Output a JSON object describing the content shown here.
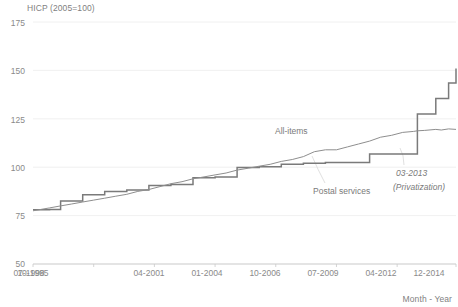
{
  "chart": {
    "title": "HICP (2005=100)",
    "xlabel": "Month - Year",
    "labels": {
      "all_items": "All-items",
      "postal": "Postal services"
    },
    "annotations": {
      "date": "03-2013",
      "event": "(Privatization)"
    },
    "colors": {
      "line": "#808080",
      "step": "#7a7a7a",
      "grid": "#e8e8e8",
      "text": "#808080"
    }
  },
  "chart_data": {
    "type": "line",
    "title": "HICP (2005=100)",
    "subtitle": "",
    "xlabel": "Month - Year",
    "ylabel": "HICP (2005=100)",
    "ylim": [
      50,
      175
    ],
    "yticks": [
      50,
      75,
      100,
      125,
      150,
      175
    ],
    "ytick_labels": [
      "50",
      "75",
      "100",
      "125",
      "150",
      "175"
    ],
    "grid": true,
    "legend_position": "inline-annotation",
    "xlim": [
      "10-1995",
      "12-2014"
    ],
    "xticks": [
      "10-1995",
      "07-1998",
      "04-2001",
      "01-2004",
      "10-2006",
      "07-2009",
      "04-2012",
      "12-2014"
    ],
    "annotations": [
      {
        "text": "03-2013",
        "x": "03-2013",
        "y": 112
      },
      {
        "text": "(Privatization)",
        "x": "03-2013",
        "y": 107
      },
      {
        "text": "All-items",
        "x": "01-2010",
        "y": 122
      },
      {
        "text": "Postal services",
        "x": "07-2011",
        "y": 97
      }
    ],
    "series": [
      {
        "name": "Postal services",
        "style": "step",
        "x": [
          "10-1995",
          "07-1996",
          "01-1997",
          "07-1997",
          "01-1998",
          "07-1998",
          "01-1999",
          "07-1999",
          "01-2000",
          "07-2000",
          "01-2001",
          "07-2001",
          "01-2002",
          "07-2002",
          "01-2003",
          "07-2003",
          "01-2004",
          "07-2004",
          "01-2005",
          "07-2005",
          "01-2006",
          "07-2006",
          "01-2007",
          "07-2007",
          "01-2008",
          "07-2008",
          "01-2009",
          "07-2009",
          "01-2010",
          "07-2010",
          "01-2011",
          "07-2011",
          "01-2012",
          "07-2012",
          "01-2013",
          "03-2013",
          "07-2013",
          "01-2014",
          "04-2014",
          "08-2014",
          "12-2014"
        ],
        "values": [
          78.0,
          78.2,
          82.5,
          82.5,
          85.8,
          85.8,
          87.5,
          87.5,
          88.2,
          88.2,
          90.5,
          90.5,
          91.0,
          91.0,
          94.5,
          94.5,
          95.0,
          95.0,
          99.8,
          99.8,
          100.2,
          100.2,
          101.5,
          101.5,
          102.0,
          102.0,
          102.5,
          102.5,
          102.5,
          102.5,
          106.8,
          106.8,
          106.8,
          106.8,
          106.8,
          127.5,
          127.5,
          135.5,
          135.5,
          143.5,
          151.0
        ]
      },
      {
        "name": "All-items",
        "style": "line",
        "x": [
          "10-1995",
          "07-1996",
          "01-1997",
          "07-1997",
          "01-1998",
          "07-1998",
          "01-1999",
          "07-1999",
          "01-2000",
          "07-2000",
          "01-2001",
          "07-2001",
          "01-2002",
          "07-2002",
          "01-2003",
          "07-2003",
          "01-2004",
          "07-2004",
          "01-2005",
          "07-2005",
          "01-2006",
          "07-2006",
          "01-2007",
          "07-2007",
          "01-2008",
          "07-2008",
          "01-2009",
          "07-2009",
          "01-2010",
          "07-2010",
          "01-2011",
          "07-2011",
          "01-2012",
          "07-2012",
          "01-2013",
          "03-2013",
          "07-2013",
          "01-2014",
          "04-2014",
          "08-2014",
          "12-2014"
        ],
        "values": [
          77.5,
          79.0,
          80.0,
          81.0,
          82.0,
          83.0,
          84.0,
          85.0,
          86.0,
          87.5,
          88.5,
          90.0,
          91.5,
          92.5,
          94.0,
          95.0,
          96.0,
          97.0,
          98.5,
          99.5,
          100.5,
          101.5,
          103.0,
          104.0,
          105.5,
          108.0,
          109.0,
          109.0,
          110.5,
          112.0,
          113.5,
          115.5,
          116.5,
          118.0,
          118.5,
          118.8,
          119.0,
          119.5,
          119.2,
          119.8,
          119.5
        ]
      }
    ]
  }
}
